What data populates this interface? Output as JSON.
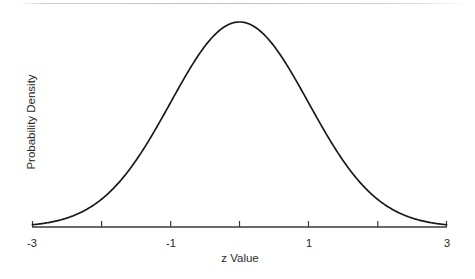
{
  "figure": {
    "background_color": "#ffffff",
    "axis_color": "#3a3a3a",
    "curve_color": "#1a1a1a"
  },
  "axes": {
    "x_title": "z Value",
    "y_title": "Probability Density",
    "x_tick_labels": [
      "-3",
      "-1",
      "1",
      "3"
    ]
  },
  "chart_data": {
    "type": "line",
    "title": "",
    "subtitle": "",
    "xlabel": "z Value",
    "ylabel": "Probability Density",
    "xlim": [
      -3,
      3
    ],
    "ylim": [
      0,
      0.4
    ],
    "grid": false,
    "legend": null,
    "annotations": [],
    "x_ticks": [
      -3,
      -2,
      -1,
      0,
      1,
      2,
      3
    ],
    "x_ticklabels": [
      "-3",
      "",
      "-1",
      "",
      "1",
      "",
      "3"
    ],
    "y_ticks": [],
    "y_ticklabels": [],
    "series": [
      {
        "name": "standard normal pdf",
        "x": [
          -3,
          -2.8,
          -2.6,
          -2.4,
          -2.2,
          -2,
          -1.8,
          -1.6,
          -1.4,
          -1.2,
          -1,
          -0.8,
          -0.6,
          -0.4,
          -0.2,
          0,
          0.2,
          0.4,
          0.6,
          0.8,
          1,
          1.2,
          1.4,
          1.6,
          1.8,
          2,
          2.2,
          2.4,
          2.6,
          2.8,
          3
        ],
        "y": [
          0.0044,
          0.0079,
          0.0136,
          0.0224,
          0.0355,
          0.054,
          0.079,
          0.1109,
          0.1497,
          0.1942,
          0.242,
          0.2897,
          0.3332,
          0.3683,
          0.391,
          0.3989,
          0.391,
          0.3683,
          0.3332,
          0.2897,
          0.242,
          0.1942,
          0.1497,
          0.1109,
          0.079,
          0.054,
          0.0355,
          0.0224,
          0.0136,
          0.0079,
          0.0044
        ]
      }
    ]
  }
}
